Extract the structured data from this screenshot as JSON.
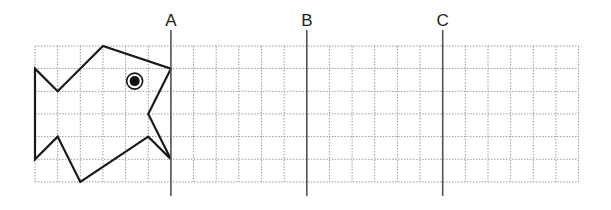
{
  "grid": {
    "origin_x": 35,
    "origin_y": 46,
    "cell": 22.65,
    "cols": 24,
    "rows": 6,
    "line_color": "#9a9a9a"
  },
  "fish": {
    "points_grid": [
      [
        0,
        1
      ],
      [
        1,
        2
      ],
      [
        3,
        0
      ],
      [
        6,
        1
      ],
      [
        5,
        3
      ],
      [
        6,
        5
      ],
      [
        5,
        4
      ],
      [
        2,
        6
      ],
      [
        1,
        4
      ],
      [
        0,
        5
      ]
    ],
    "eye_grid": [
      4.4,
      1.55
    ],
    "stroke": "#1a1a1a"
  },
  "lines": [
    {
      "label": "A",
      "col": 6
    },
    {
      "label": "B",
      "col": 12
    },
    {
      "label": "C",
      "col": 18
    }
  ],
  "line_top": 30,
  "line_bottom": 196
}
